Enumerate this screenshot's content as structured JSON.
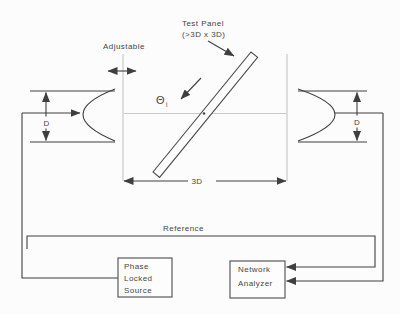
{
  "diagram": {
    "test_panel_label": [
      "Test Panel",
      "(>3D x 3D)"
    ],
    "adjustable_label": "Adjustable",
    "incidence_angle": {
      "symbol": "Θ",
      "subscript": "i"
    },
    "dimensions": {
      "aperture_left": "D",
      "aperture_right": "D",
      "separation": "3D"
    },
    "reference_label": "Reference",
    "source_box": {
      "lines": [
        "Phase",
        "Locked",
        "Source"
      ]
    },
    "analyzer_box": {
      "lines": [
        "Network",
        "Analyzer"
      ]
    }
  },
  "colors": {
    "line": "#3f3f3f",
    "faint_guide": "#c9c9c9",
    "text": "#454545",
    "box_border": "#5a5a5a",
    "background": "#fcfcfc"
  }
}
